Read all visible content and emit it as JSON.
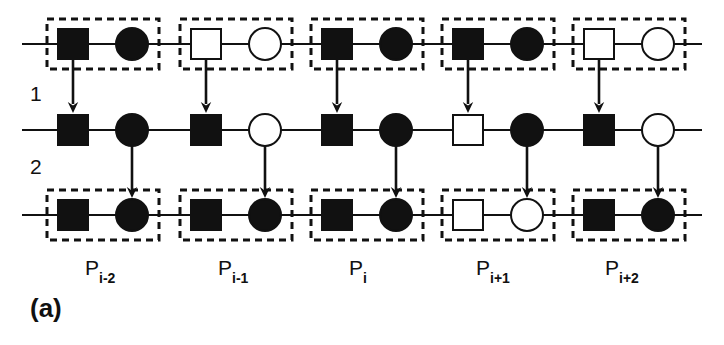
{
  "figure": {
    "panel_label": "(a)",
    "row_labels": [
      {
        "text": "1",
        "x": 30,
        "y": 82
      },
      {
        "text": "2",
        "x": 30,
        "y": 155
      }
    ],
    "period_labels": [
      {
        "base": "P",
        "sub": "i-2",
        "cx": 107
      },
      {
        "base": "P",
        "sub": "i-1",
        "cx": 240
      },
      {
        "base": "P",
        "sub": "i",
        "cx": 371
      },
      {
        "base": "P",
        "sub": "i+1",
        "cx": 498
      },
      {
        "base": "P",
        "sub": "i+2",
        "cx": 627
      }
    ],
    "colors": {
      "ink": "#111111",
      "fill_dark": "#111111",
      "fill_light": "#ffffff",
      "background": "#ffffff"
    },
    "geometry": {
      "row_y": [
        44,
        130,
        215
      ],
      "square_size": 30,
      "circle_radius": 16,
      "group_pad_x": 11,
      "group_pad_y": 10,
      "dash_pattern": "7 5",
      "dash_width": 3,
      "line_width": 2,
      "chain_left_x": 22,
      "chain_right_x": 702
    },
    "rows": [
      {
        "name": "row-1-top",
        "index": 1,
        "boxed": true,
        "groups": [
          {
            "square": {
              "fill": "dark",
              "cx": 73
            },
            "circle": {
              "fill": "dark",
              "cx": 132
            }
          },
          {
            "square": {
              "fill": "light",
              "cx": 206
            },
            "circle": {
              "fill": "light",
              "cx": 265
            }
          },
          {
            "square": {
              "fill": "dark",
              "cx": 337
            },
            "circle": {
              "fill": "dark",
              "cx": 396
            }
          },
          {
            "square": {
              "fill": "dark",
              "cx": 468
            },
            "circle": {
              "fill": "dark",
              "cx": 527
            }
          },
          {
            "square": {
              "fill": "light",
              "cx": 599
            },
            "circle": {
              "fill": "light",
              "cx": 658
            }
          }
        ]
      },
      {
        "name": "row-2-middle",
        "index": 2,
        "boxed": false,
        "groups": [
          {
            "square": {
              "fill": "dark",
              "cx": 73
            },
            "circle": {
              "fill": "dark",
              "cx": 132
            }
          },
          {
            "square": {
              "fill": "dark",
              "cx": 206
            },
            "circle": {
              "fill": "light",
              "cx": 265
            }
          },
          {
            "square": {
              "fill": "dark",
              "cx": 337
            },
            "circle": {
              "fill": "dark",
              "cx": 396
            }
          },
          {
            "square": {
              "fill": "light",
              "cx": 468
            },
            "circle": {
              "fill": "dark",
              "cx": 527
            }
          },
          {
            "square": {
              "fill": "dark",
              "cx": 599
            },
            "circle": {
              "fill": "light",
              "cx": 658
            }
          }
        ]
      },
      {
        "name": "row-3-bottom",
        "index": 3,
        "boxed": true,
        "groups": [
          {
            "square": {
              "fill": "dark",
              "cx": 73
            },
            "circle": {
              "fill": "dark",
              "cx": 132
            }
          },
          {
            "square": {
              "fill": "dark",
              "cx": 206
            },
            "circle": {
              "fill": "dark",
              "cx": 265
            }
          },
          {
            "square": {
              "fill": "dark",
              "cx": 337
            },
            "circle": {
              "fill": "dark",
              "cx": 396
            }
          },
          {
            "square": {
              "fill": "light",
              "cx": 468
            },
            "circle": {
              "fill": "light",
              "cx": 527
            }
          },
          {
            "square": {
              "fill": "dark",
              "cx": 599
            },
            "circle": {
              "fill": "dark",
              "cx": 658
            }
          }
        ]
      }
    ],
    "arrows": [
      {
        "name": "arrow-top-to-middle-1",
        "x": 73,
        "y1": 60,
        "y2": 113
      },
      {
        "name": "arrow-top-to-middle-2",
        "x": 206,
        "y1": 60,
        "y2": 113
      },
      {
        "name": "arrow-top-to-middle-3",
        "x": 337,
        "y1": 60,
        "y2": 113
      },
      {
        "name": "arrow-top-to-middle-4",
        "x": 468,
        "y1": 60,
        "y2": 113
      },
      {
        "name": "arrow-top-to-middle-5",
        "x": 599,
        "y1": 60,
        "y2": 113
      },
      {
        "name": "arrow-middle-to-bottom-1",
        "x": 132,
        "y1": 146,
        "y2": 198
      },
      {
        "name": "arrow-middle-to-bottom-2",
        "x": 265,
        "y1": 146,
        "y2": 198
      },
      {
        "name": "arrow-middle-to-bottom-3",
        "x": 396,
        "y1": 146,
        "y2": 198
      },
      {
        "name": "arrow-middle-to-bottom-4",
        "x": 527,
        "y1": 146,
        "y2": 198
      },
      {
        "name": "arrow-middle-to-bottom-5",
        "x": 658,
        "y1": 146,
        "y2": 198
      }
    ]
  }
}
